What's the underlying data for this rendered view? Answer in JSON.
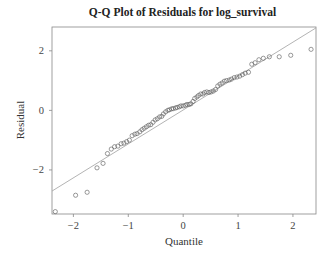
{
  "chart_data": {
    "type": "scatter",
    "title": "Q-Q Plot of Residuals for log_survival",
    "xlabel": "Quantile",
    "ylabel": "Residual",
    "xlim": [
      -2.39,
      2.42
    ],
    "ylim": [
      -3.48,
      2.8
    ],
    "xticks": [
      -2,
      -1,
      0,
      1,
      2
    ],
    "xtick_labels": [
      "−2",
      "−1",
      "0",
      "1",
      "2"
    ],
    "yticks": [
      2,
      0,
      -2
    ],
    "ytick_labels": [
      "2",
      "0",
      "−2"
    ],
    "grid": false,
    "legend": null,
    "reference_line": {
      "x": [
        -2.39,
        2.42
      ],
      "y": [
        -2.71,
        2.77
      ],
      "color": "#aaaaaa"
    },
    "marker": {
      "shape": "open-circle",
      "color": "#555555"
    },
    "series": [
      {
        "name": "residuals",
        "x": [
          -2.33,
          -1.96,
          -1.75,
          -1.57,
          -1.46,
          -1.38,
          -1.31,
          -1.25,
          -1.19,
          -1.13,
          -1.08,
          -1.03,
          -0.98,
          -0.93,
          -0.88,
          -0.84,
          -0.79,
          -0.75,
          -0.71,
          -0.67,
          -0.63,
          -0.59,
          -0.55,
          -0.51,
          -0.47,
          -0.43,
          -0.39,
          -0.36,
          -0.32,
          -0.28,
          -0.25,
          -0.21,
          -0.18,
          -0.14,
          -0.11,
          -0.07,
          -0.04,
          0.0,
          0.04,
          0.07,
          0.11,
          0.14,
          0.18,
          0.21,
          0.25,
          0.28,
          0.32,
          0.36,
          0.39,
          0.43,
          0.47,
          0.51,
          0.55,
          0.59,
          0.63,
          0.67,
          0.71,
          0.75,
          0.79,
          0.84,
          0.88,
          0.93,
          0.98,
          1.03,
          1.08,
          1.13,
          1.19,
          1.25,
          1.31,
          1.38,
          1.46,
          1.57,
          1.75,
          1.96,
          2.33
        ],
        "y": [
          -3.4,
          -2.85,
          -2.75,
          -1.93,
          -1.78,
          -1.45,
          -1.3,
          -1.22,
          -1.2,
          -1.12,
          -1.1,
          -1.05,
          -1.0,
          -0.85,
          -0.8,
          -0.78,
          -0.72,
          -0.65,
          -0.6,
          -0.55,
          -0.5,
          -0.48,
          -0.4,
          -0.32,
          -0.28,
          -0.22,
          -0.2,
          -0.12,
          -0.05,
          0.0,
          0.02,
          0.05,
          0.06,
          0.08,
          0.1,
          0.12,
          0.15,
          0.15,
          0.17,
          0.2,
          0.2,
          0.22,
          0.3,
          0.4,
          0.45,
          0.5,
          0.55,
          0.55,
          0.6,
          0.62,
          0.6,
          0.62,
          0.65,
          0.7,
          0.82,
          0.88,
          0.92,
          0.98,
          1.0,
          1.02,
          1.05,
          1.1,
          1.12,
          1.15,
          1.2,
          1.25,
          1.28,
          1.55,
          1.6,
          1.7,
          1.75,
          1.8,
          1.8,
          1.85,
          2.05
        ]
      }
    ]
  }
}
